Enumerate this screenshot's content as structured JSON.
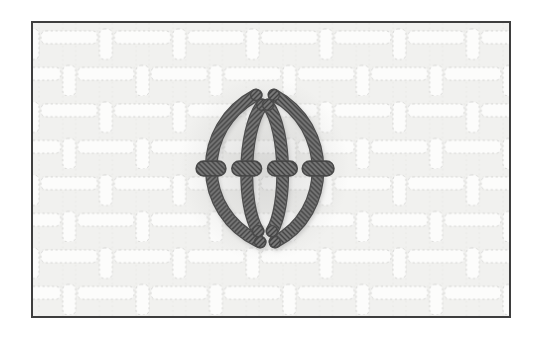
{
  "illustration": {
    "subject": "embroidery-stitch-diagram",
    "depicts": "four curved vertical stitches forming a pointed oval, tied at the middle by four horizontal couching bars, worked on woven canvas fabric",
    "page_background": "#ffffff"
  },
  "frame": {
    "left": 31,
    "top": 21,
    "width": 480,
    "height": 297,
    "border_color": "#3e3e3e",
    "border_width": 2.5
  },
  "fabric": {
    "base_color": "#f1f1ef",
    "pill_fill": "#fcfcfb",
    "pill_edge": "#d2d2d0",
    "guide_color": "#e4e4e2"
  },
  "shadow": {
    "color": "#7e7e7e",
    "blur_color": "#9a9a9a",
    "cx": 233,
    "cy": 148,
    "rx": 86,
    "ry": 94
  },
  "thread": {
    "fill_color": "#787878",
    "outline_color": "#4c4c4c",
    "hatch_color": "#3f3f3f",
    "width": 10.5,
    "outline_width": 13
  },
  "stitch": {
    "verticals": [
      {
        "name": "outer-left-thread",
        "d": "M 225,73 C 164,105 164,192 229,222",
        "hatch": "A"
      },
      {
        "name": "outer-right-thread",
        "d": "M 243,73 C 302,105 302,192 244,222",
        "hatch": "B"
      },
      {
        "name": "inner-left-thread",
        "d": "M 231,83 C 211,110 211,186 227,211",
        "hatch": "A"
      },
      {
        "name": "inner-right-thread",
        "d": "M 237,83 C 256,110 256,186 241,211",
        "hatch": "B"
      }
    ],
    "tie_bars": [
      {
        "name": "tie-bar-1",
        "cx": 179.5,
        "cy": 147.5,
        "w": 30,
        "h": 15
      },
      {
        "name": "tie-bar-2",
        "cx": 215.5,
        "cy": 147.5,
        "w": 30,
        "h": 15
      },
      {
        "name": "tie-bar-3",
        "cx": 251.5,
        "cy": 147.5,
        "w": 30,
        "h": 15
      },
      {
        "name": "tie-bar-4",
        "cx": 287.5,
        "cy": 147.5,
        "w": 32,
        "h": 15
      }
    ],
    "tips": [
      {
        "x": 231,
        "y": 83
      },
      {
        "x": 237,
        "y": 83
      },
      {
        "x": 227,
        "y": 211
      },
      {
        "x": 241,
        "y": 211
      },
      {
        "x": 225,
        "y": 73
      },
      {
        "x": 243,
        "y": 73
      },
      {
        "x": 229,
        "y": 222
      },
      {
        "x": 244,
        "y": 222
      }
    ]
  }
}
